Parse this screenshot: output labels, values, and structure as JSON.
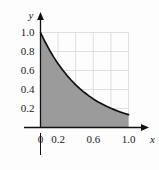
{
  "chart_data": {
    "type": "area",
    "title": "",
    "subtitle": "",
    "xlabel": "x",
    "ylabel": "y",
    "xlim": [
      0,
      1.0
    ],
    "ylim": [
      0,
      1.0
    ],
    "grid": true,
    "legend": false,
    "curve_label": "",
    "series": [
      {
        "name": "y = e^(-2x)",
        "x": [
          0.0,
          0.05,
          0.1,
          0.15,
          0.2,
          0.25,
          0.3,
          0.35,
          0.4,
          0.45,
          0.5,
          0.55,
          0.6,
          0.65,
          0.7,
          0.75,
          0.8,
          0.85,
          0.9,
          0.95,
          1.0
        ],
        "values": [
          1.0,
          0.905,
          0.819,
          0.741,
          0.67,
          0.607,
          0.549,
          0.497,
          0.449,
          0.407,
          0.368,
          0.333,
          0.301,
          0.272,
          0.247,
          0.223,
          0.202,
          0.183,
          0.165,
          0.15,
          0.135
        ],
        "fill": true,
        "fill_color": "#9b9b9b",
        "line_color": "#111111"
      }
    ],
    "x_ticks": [
      {
        "value": 0.0,
        "label": "0"
      },
      {
        "value": 0.2,
        "label": "0.2"
      },
      {
        "value": 0.4,
        "label": ""
      },
      {
        "value": 0.6,
        "label": "0.6"
      },
      {
        "value": 0.8,
        "label": ""
      },
      {
        "value": 1.0,
        "label": "1.0"
      }
    ],
    "y_ticks": [
      {
        "value": 0.2,
        "label": "0.2"
      },
      {
        "value": 0.4,
        "label": "0.4"
      },
      {
        "value": 0.6,
        "label": "0.6"
      },
      {
        "value": 0.8,
        "label": "0.8"
      },
      {
        "value": 1.0,
        "label": "1.0"
      }
    ],
    "colors": {
      "background": "#fdfdfd",
      "grid": "#d8d8d8",
      "axis": "#111111",
      "fill": "#9b9b9b",
      "curve": "#111111",
      "text": "#1a1a1a"
    }
  }
}
